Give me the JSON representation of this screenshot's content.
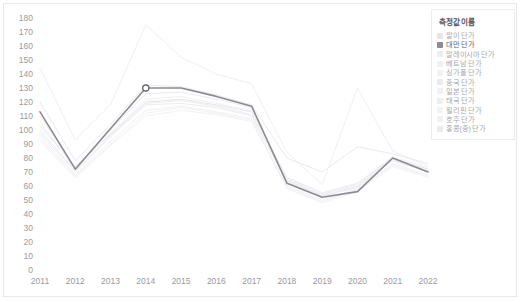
{
  "chart_data": {
    "type": "line",
    "title": "",
    "xlabel": "",
    "ylabel": "",
    "categories": [
      2011,
      2012,
      2013,
      2014,
      2015,
      2016,
      2017,
      2018,
      2019,
      2020,
      2021,
      2022
    ],
    "x_tick_labels": [
      "2011",
      "2012",
      "2013",
      "2014",
      "2015",
      "2016",
      "2017",
      "2018",
      "2019",
      "2020",
      "2021",
      "2022"
    ],
    "y_tick_labels": [
      "0",
      "10",
      "20",
      "30",
      "40",
      "50",
      "60",
      "70",
      "80",
      "90",
      "100",
      "110",
      "120",
      "130",
      "140",
      "150",
      "160",
      "170",
      "180"
    ],
    "ylim": [
      0,
      180
    ],
    "ytick_step": 10,
    "grid": false,
    "legend_position": "right",
    "highlight_point": {
      "series": "대만 단가",
      "x": 2014,
      "y": 130
    },
    "series": [
      {
        "name": "말이 단가",
        "color": "#e6e6e8",
        "values": [
          103,
          74,
          97,
          120,
          122,
          118,
          113,
          66,
          55,
          62,
          80,
          72
        ]
      },
      {
        "name": "대만 단가",
        "color": "#8b8b91",
        "values": [
          113,
          72,
          101,
          130,
          130,
          124,
          117,
          62,
          52,
          56,
          80,
          70
        ],
        "highlight": true
      },
      {
        "name": "말레이시아 단가",
        "color": "#ededf0",
        "values": [
          98,
          70,
          95,
          118,
          119,
          116,
          110,
          63,
          53,
          60,
          78,
          70
        ]
      },
      {
        "name": "베트남 단가",
        "color": "#f0f0f2",
        "values": [
          144,
          93,
          118,
          175,
          152,
          140,
          133,
          84,
          61,
          130,
          85,
          74
        ]
      },
      {
        "name": "싱가폴 단가",
        "color": "#f1f1f3",
        "values": [
          96,
          68,
          92,
          114,
          117,
          113,
          108,
          60,
          50,
          58,
          76,
          68
        ]
      },
      {
        "name": "중국 단가",
        "color": "#ebebee",
        "values": [
          110,
          73,
          100,
          126,
          127,
          122,
          116,
          64,
          53,
          59,
          79,
          71
        ]
      },
      {
        "name": "일본 단가",
        "color": "#f2f2f4",
        "values": [
          94,
          67,
          90,
          112,
          116,
          112,
          107,
          59,
          49,
          57,
          75,
          67
        ]
      },
      {
        "name": "태국 단가",
        "color": "#eeeef1",
        "values": [
          100,
          71,
          96,
          119,
          121,
          117,
          111,
          64,
          54,
          61,
          79,
          71
        ]
      },
      {
        "name": "필리핀 단가",
        "color": "#f3f3f5",
        "values": [
          92,
          66,
          89,
          110,
          114,
          111,
          106,
          58,
          48,
          56,
          74,
          66
        ]
      },
      {
        "name": "호주 단가",
        "color": "#f1f1f4",
        "values": [
          106,
          72,
          98,
          122,
          124,
          119,
          114,
          65,
          55,
          62,
          81,
          73
        ]
      },
      {
        "name": "홍콩(중) 단가",
        "color": "#eaeaed",
        "values": [
          120,
          78,
          104,
          132,
          131,
          125,
          118,
          80,
          70,
          88,
          83,
          76
        ]
      }
    ]
  },
  "legend": {
    "title": "측정값 이름",
    "items": [
      {
        "label": "말이 단가"
      },
      {
        "label": "대만 단가"
      },
      {
        "label": "말레이시아 단가"
      },
      {
        "label": "베트남 단가"
      },
      {
        "label": "싱가폴 단가"
      },
      {
        "label": "중국 단가"
      },
      {
        "label": "일본 단가"
      },
      {
        "label": "태국 단가"
      },
      {
        "label": "필리핀 단가"
      },
      {
        "label": "호주 단가"
      },
      {
        "label": "홍콩(중) 단가"
      }
    ]
  },
  "colors": {
    "highlight_line": "#8b8b91",
    "marker_fill": "#ffffff",
    "marker_stroke": "#55555c",
    "axis_text": "#9a9aa0",
    "frame": "#e9e9ec"
  }
}
